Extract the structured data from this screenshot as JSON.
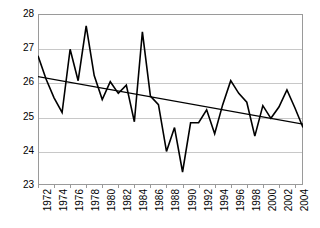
{
  "chart_data": {
    "type": "line",
    "title": "",
    "xlabel": "",
    "ylabel": "",
    "ylim": [
      23,
      28
    ],
    "xlim": [
      1972,
      2005
    ],
    "grid": true,
    "legend": false,
    "y_ticks": [
      28,
      27,
      26,
      25,
      24,
      23
    ],
    "x_ticks": [
      1972,
      1974,
      1976,
      1978,
      1980,
      1982,
      1984,
      1986,
      1988,
      1990,
      1992,
      1994,
      1996,
      1998,
      2000,
      2002,
      2004
    ],
    "x": [
      1972,
      1973,
      1974,
      1975,
      1976,
      1977,
      1978,
      1979,
      1980,
      1981,
      1982,
      1983,
      1984,
      1985,
      1986,
      1987,
      1988,
      1989,
      1990,
      1991,
      1992,
      1993,
      1994,
      1995,
      1996,
      1997,
      1998,
      1999,
      2000,
      2001,
      2002,
      2003,
      2004,
      2005
    ],
    "series": [
      {
        "name": "observed",
        "color": "#000000",
        "values": [
          26.78,
          26.1,
          25.55,
          25.12,
          26.97,
          26.05,
          27.65,
          26.2,
          25.5,
          26.02,
          25.68,
          25.92,
          24.85,
          27.48,
          25.6,
          25.35,
          23.98,
          24.68,
          23.38,
          24.82,
          24.82,
          25.2,
          24.5,
          25.35,
          26.05,
          25.68,
          25.42,
          24.43,
          25.32,
          24.95,
          25.28,
          25.78,
          25.25,
          24.68
        ]
      },
      {
        "name": "linear-trend",
        "color": "#000000",
        "start_value": 26.17,
        "end_value": 24.78
      }
    ]
  },
  "axis": {
    "y_labels": [
      "28",
      "27",
      "26",
      "25",
      "24",
      "23"
    ],
    "x_labels": [
      "1972",
      "1974",
      "1976",
      "1978",
      "1980",
      "1982",
      "1984",
      "1986",
      "1988",
      "1990",
      "1992",
      "1994",
      "1996",
      "1998",
      "2000",
      "2002",
      "2004"
    ]
  }
}
